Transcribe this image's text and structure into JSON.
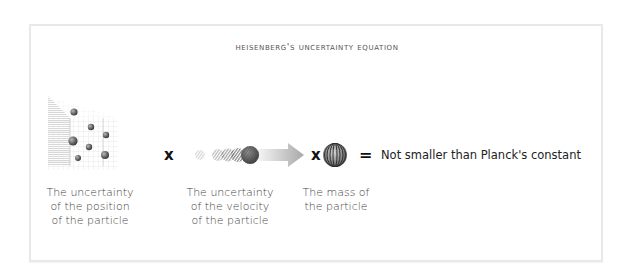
{
  "title": "Heisenberg's Uncertainty Equation",
  "equation": {
    "terms": [
      {
        "icon": "position-grid-icon",
        "label_lines": [
          "The uncertainty",
          "of the position",
          "of the particle"
        ]
      },
      {
        "icon": "velocity-motion-icon",
        "label_lines": [
          "The uncertainty",
          "of the velocity",
          "of the particle"
        ]
      },
      {
        "icon": "mass-sphere-icon",
        "label_lines": [
          "The mass of",
          "the particle"
        ]
      }
    ],
    "operators": {
      "times1": "x",
      "times2": "x",
      "equals": "="
    },
    "result": "Not smaller than Planck's constant"
  },
  "colors": {
    "frame_border": "#e8e8e8",
    "text": "#444444",
    "operator": "#111111",
    "sphere_dark": "#4a4a4a",
    "arrow": "#b5b5b5"
  }
}
